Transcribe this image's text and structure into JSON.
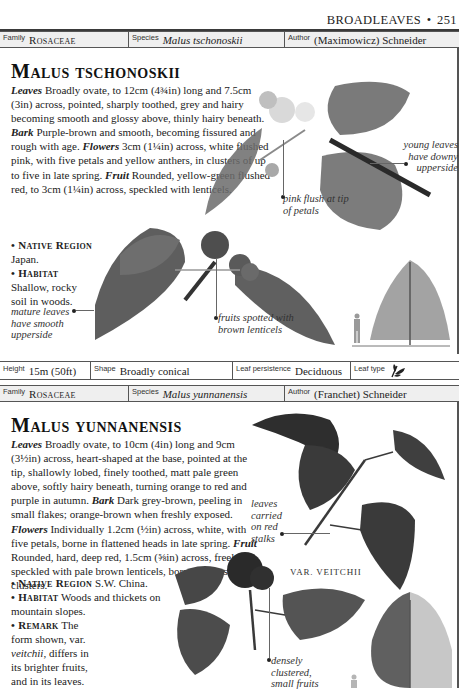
{
  "page_header": {
    "section": "BROADLEAVES",
    "separator": "•",
    "page_number": "251"
  },
  "entries": [
    {
      "info_top": {
        "family_label": "Family",
        "family": "Rosaceae",
        "species_label": "Species",
        "species": "Malus tschonoskii",
        "author_label": "Author",
        "author": "(Maximowicz) Schneider"
      },
      "title": "Malus tschonoskii",
      "description": {
        "leaves_head": "Leaves",
        "leaves": " Broadly ovate, to 12cm (4¾in) long and 7.5cm (3in) across, pointed, sharply toothed, grey and hairy becoming smooth and glossy above, thinly hairy beneath. ",
        "bark_head": "Bark",
        "bark": " Purple-brown and smooth, becoming fissured and rough with age. ",
        "flowers_head": "Flowers",
        "flowers": " 3cm (1¼in) across, white flushed pink, with five petals and yellow anthers, in clusters of up to five in late spring. ",
        "fruit_head": "Fruit",
        "fruit": " Rounded, yellow-green flushed red, to 3cm (1¼in) across, speckled with lenticels.",
        "native_region_head": "• Native Region",
        "native_region": " Japan.",
        "habitat_head": "• Habitat",
        "habitat": " Shallow, rocky soil in woods."
      },
      "captions": {
        "young_leaves": "young leaves have downy upperside",
        "pink_flush": "pink flush at tip of petals",
        "mature_leaves": "mature leaves have smooth upperside",
        "fruits": "fruits spotted with brown lenticels"
      },
      "info_bottom": {
        "height_label": "Height",
        "height": "15m (50ft)",
        "shape_label": "Shape",
        "shape": "Broadly conical",
        "persistence_label": "Leaf persistence",
        "persistence": "Deciduous",
        "leaf_type_label": "Leaf type",
        "leaf_type_icon": "simple-leaf-icon"
      }
    },
    {
      "info_top": {
        "family_label": "Family",
        "family": "Rosaceae",
        "species_label": "Species",
        "species": "Malus yunnanensis",
        "author_label": "Author",
        "author": "(Franchet) Schneider"
      },
      "title": "Malus yunnanensis",
      "description": {
        "leaves_head": "Leaves",
        "leaves": " Broadly ovate, to 10cm (4in) long and 9cm (3½in) across, heart-shaped at the base, pointed at the tip, shallowly lobed, finely toothed, matt pale green above, softly hairy beneath, turning orange to red and purple in autumn. ",
        "bark_head": "Bark",
        "bark": " Dark grey-brown, peeling in small flakes; orange-brown when freshly exposed. ",
        "flowers_head": "Flowers",
        "flowers": " Individually 1.2cm (½in) across, white, with five petals, borne in flattened heads in late spring. ",
        "fruit_head": "Fruit",
        "fruit": " Rounded, hard, deep red, 1.5cm (⅝in) across, freely speckled with pale brown lenticels, borne in dense clusters.",
        "native_region_head": "• Native Region",
        "native_region": " S.W. China.",
        "habitat_head": "• Habitat",
        "habitat": " Woods and thickets on mountain slopes.",
        "remark_head": "• Remark",
        "remark_1": " The form shown, var. ",
        "remark_var": "veitchii",
        "remark_2": ", differs in its brighter fruits, and in its leaves."
      },
      "captions": {
        "red_stalks": "leaves carried on red stalks",
        "var_label": "VAR. VEITCHII",
        "dense_fruits": "densely clustered, small fruits"
      }
    }
  ]
}
